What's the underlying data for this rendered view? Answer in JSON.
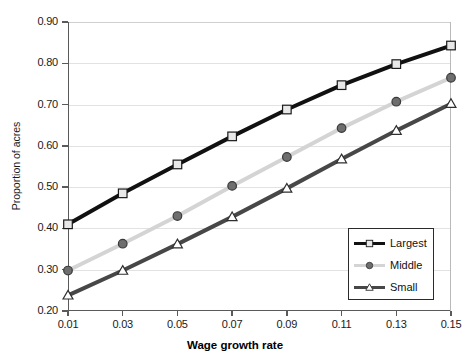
{
  "chart_data": {
    "type": "line",
    "title": "",
    "xlabel": "Wage growth rate",
    "ylabel": "Proportion of acres",
    "x": [
      0.01,
      0.03,
      0.05,
      0.07,
      0.09,
      0.11,
      0.13,
      0.15
    ],
    "xtick_labels": [
      "0.01",
      "0.03",
      "0.05",
      "0.07",
      "0.09",
      "0.11",
      "0.13",
      "0.15"
    ],
    "ytick_labels": [
      "0.20",
      "0.30",
      "0.40",
      "0.50",
      "0.60",
      "0.70",
      "0.80",
      "0.90"
    ],
    "ytick_values": [
      0.2,
      0.3,
      0.4,
      0.5,
      0.6,
      0.7,
      0.8,
      0.9
    ],
    "xlim": [
      0.01,
      0.15
    ],
    "ylim": [
      0.2,
      0.9
    ],
    "grid": true,
    "grid_axis": "y",
    "legend_position": "lower-right",
    "series": [
      {
        "name": "Largest",
        "marker": "square",
        "color": "#111111",
        "marker_fill": "#e8e8e8",
        "values": [
          0.41,
          0.485,
          0.555,
          0.623,
          0.688,
          0.747,
          0.798,
          0.843
        ]
      },
      {
        "name": "Middle",
        "marker": "circle",
        "color": "#d4d4d4",
        "marker_fill": "#6e6e6e",
        "values": [
          0.298,
          0.363,
          0.43,
          0.503,
          0.573,
          0.643,
          0.707,
          0.765
        ]
      },
      {
        "name": "Small",
        "marker": "triangle",
        "color": "#474747",
        "marker_fill": "#ffffff",
        "values": [
          0.238,
          0.298,
          0.362,
          0.428,
          0.497,
          0.568,
          0.637,
          0.702
        ]
      }
    ]
  }
}
